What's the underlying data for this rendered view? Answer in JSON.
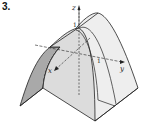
{
  "figure": {
    "number": "3."
  },
  "axes": {
    "x_label": "x",
    "y_label": "y",
    "z_label": "z",
    "z_tick": "1",
    "y_tick": "1"
  },
  "colors": {
    "surface_light": "#ececec",
    "surface_mid": "#d6d6d6",
    "surface_dark": "#a8a8a8",
    "outline": "#222222"
  }
}
